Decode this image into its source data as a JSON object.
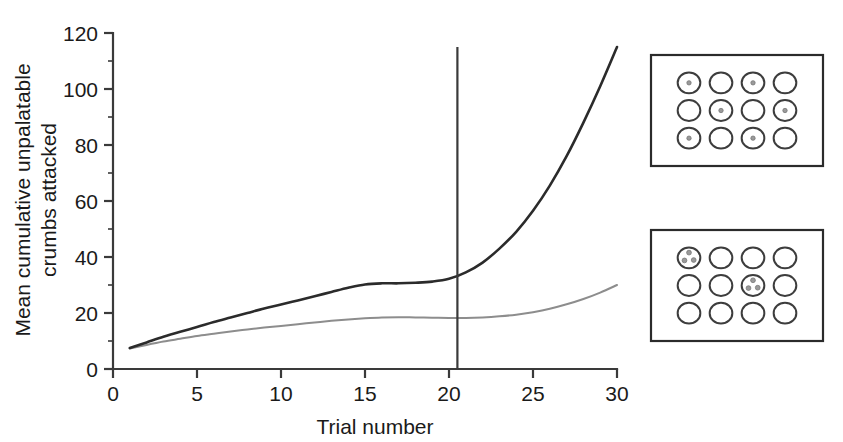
{
  "figure": {
    "caption_present": false,
    "background_color": "#ffffff"
  },
  "chart_data": {
    "type": "line",
    "title": "",
    "xlabel": "Trial number",
    "ylabel": "Mean cumulative unpalatable crumbs attacked",
    "ylabel_line1": "Mean cumulative unpalatable",
    "ylabel_line2": "crumbs attacked",
    "xlim": [
      0,
      30
    ],
    "ylim": [
      0,
      120
    ],
    "xticks": [
      0,
      5,
      10,
      15,
      20,
      25,
      30
    ],
    "xtick_labels": [
      "0",
      "5",
      "10",
      "15",
      "20",
      "25",
      "30"
    ],
    "yticks": [
      0,
      20,
      40,
      60,
      80,
      100,
      120
    ],
    "ytick_labels": [
      "0",
      "20",
      "40",
      "60",
      "80",
      "100",
      "120"
    ],
    "y_minor_ticks": [
      10,
      30,
      50,
      70,
      90,
      110
    ],
    "grid": false,
    "legend": "none",
    "annotations": [
      {
        "name": "phase-divider",
        "kind": "vertical-line",
        "x": 20.5,
        "y_top": 115,
        "y_bottom": 0,
        "color": "#3a3a3a"
      }
    ],
    "x": [
      1,
      2,
      3,
      4,
      5,
      6,
      7,
      8,
      9,
      10,
      11,
      12,
      13,
      14,
      15,
      16,
      17,
      18,
      19,
      20,
      21,
      22,
      23,
      24,
      25,
      26,
      27,
      28,
      29,
      30
    ],
    "series": [
      {
        "name": "dark-curve",
        "color": "#2b2b2b",
        "values": [
          7.5,
          9.5,
          11.5,
          13.3,
          15.0,
          16.8,
          18.4,
          20.0,
          21.6,
          23.0,
          24.5,
          26.0,
          27.5,
          29.0,
          30.2,
          30.6,
          30.6,
          30.8,
          31.2,
          32.2,
          34.5,
          38.0,
          43.0,
          49.0,
          56.5,
          65.5,
          76.0,
          88.0,
          101.0,
          115.0
        ]
      },
      {
        "name": "light-curve",
        "color": "#8d8d8d",
        "values": [
          7.3,
          8.6,
          9.8,
          10.8,
          11.8,
          12.6,
          13.4,
          14.1,
          14.8,
          15.4,
          16.0,
          16.6,
          17.2,
          17.7,
          18.1,
          18.4,
          18.5,
          18.4,
          18.3,
          18.2,
          18.2,
          18.4,
          18.8,
          19.4,
          20.3,
          21.5,
          23.1,
          25.0,
          27.3,
          30.0
        ]
      }
    ]
  },
  "panels": [
    {
      "name": "panel-top",
      "rows": 3,
      "cols": 4,
      "dots_per_marked_circle": 1,
      "marked_cells": [
        [
          0,
          0
        ],
        [
          0,
          2
        ],
        [
          1,
          1
        ],
        [
          1,
          3
        ],
        [
          2,
          0
        ],
        [
          2,
          2
        ]
      ],
      "circle_stroke": "#3d3d3d",
      "dot_color": "#9a9a9a"
    },
    {
      "name": "panel-bottom",
      "rows": 3,
      "cols": 4,
      "dots_per_marked_circle": 3,
      "marked_cells": [
        [
          0,
          0
        ],
        [
          1,
          2
        ]
      ],
      "circle_stroke": "#3d3d3d",
      "dot_color": "#9a9a9a"
    }
  ]
}
